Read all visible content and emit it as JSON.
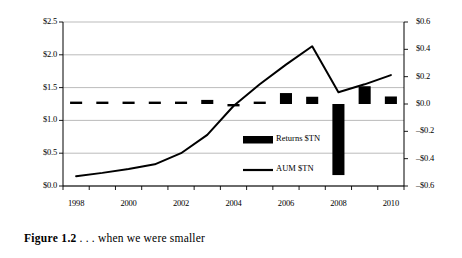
{
  "figure": {
    "caption_number": "Figure 1.2",
    "caption_text": ". . . when we were smaller"
  },
  "chart_data": {
    "type": "bar",
    "title": "",
    "xlabel": "",
    "ylabel": "",
    "grid": true,
    "legend_position": "inside-center-right",
    "categories": [
      1998,
      1999,
      2000,
      2001,
      2002,
      2003,
      2004,
      2005,
      2006,
      2007,
      2008,
      2009,
      2010
    ],
    "x_tick_labels": [
      "1998",
      "1999",
      "2000",
      "2001",
      "2002",
      "2003",
      "2004",
      "2005",
      "2006",
      "2007",
      "2008",
      "2009",
      "2010"
    ],
    "x_tick_labels_shown": [
      "1998",
      "2000",
      "2002",
      "2004",
      "2006",
      "2008",
      "2010"
    ],
    "axes": {
      "left": {
        "label": "",
        "ylim": [
          0.0,
          2.5
        ],
        "tick_values": [
          0.0,
          0.5,
          1.0,
          1.5,
          2.0,
          2.5
        ],
        "tick_labels": [
          "$0.0",
          "$0.5",
          "$1.0",
          "$1.5",
          "$2.0",
          "$2.5"
        ]
      },
      "right": {
        "label": "",
        "ylim": [
          -0.6,
          0.6
        ],
        "tick_values": [
          -0.6,
          -0.4,
          -0.2,
          0.0,
          0.2,
          0.4,
          0.6
        ],
        "tick_labels": [
          "–$0.6",
          "–$0.4",
          "–$0.2",
          "$0.0",
          "$0.2",
          "$0.4",
          "$0.6"
        ]
      }
    },
    "series": [
      {
        "name": "Returns $TN",
        "kind": "bar",
        "axis": "right",
        "color": "#000000",
        "values": [
          0.005,
          0.012,
          0.01,
          0.008,
          0.004,
          0.03,
          -0.008,
          0.012,
          0.08,
          0.053,
          -0.52,
          0.13,
          0.055
        ]
      },
      {
        "name": "AUM $TN",
        "kind": "line",
        "axis": "left",
        "color": "#000000",
        "values": [
          0.15,
          0.2,
          0.26,
          0.33,
          0.5,
          0.78,
          1.22,
          1.55,
          1.85,
          2.13,
          1.43,
          1.55,
          1.69
        ]
      }
    ],
    "legend": [
      {
        "label": "Returns $TN",
        "marker": "bar"
      },
      {
        "label": "AUM $TN",
        "marker": "line"
      }
    ]
  }
}
